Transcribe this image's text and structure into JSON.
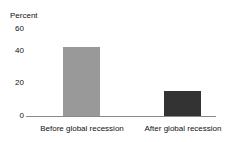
{
  "chart_data": {
    "type": "bar",
    "title": "",
    "xlabel": "",
    "ylabel": "Percent",
    "categories": [
      "Before global recession",
      "After global recession"
    ],
    "values": [
      47,
      17
    ],
    "series": [
      {
        "name": "Percent",
        "values": [
          47,
          17
        ]
      }
    ],
    "ylim": [
      0,
      60
    ],
    "yticks": [
      0,
      20,
      40,
      60
    ],
    "ytick_labels": [
      "0",
      "20",
      "40",
      "60"
    ],
    "grid": false,
    "legend": false,
    "bar_colors": [
      "#999999",
      "#333333"
    ],
    "axis_color": "#8a8a8a",
    "background": "#ffffff"
  },
  "axis": {
    "y_title": "Percent",
    "ticks": {
      "t60": "60",
      "t40": "40",
      "t20": "20",
      "t0": "0"
    }
  },
  "bars": {
    "before": {
      "label": "Before global recession",
      "value": "47",
      "color": "#999999"
    },
    "after": {
      "label": "After global recession",
      "value": "17",
      "color": "#333333"
    }
  },
  "misc": {
    "clipped_title": ""
  }
}
